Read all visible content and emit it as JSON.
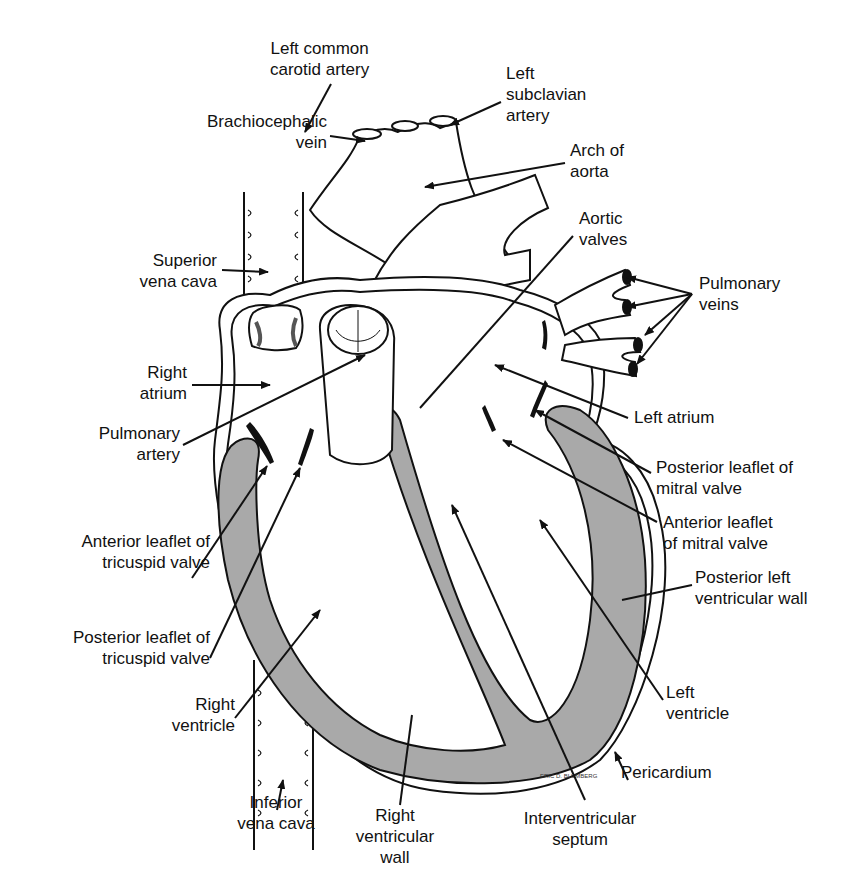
{
  "diagram": {
    "colors": {
      "line": "#111111",
      "muscle": "#a9a9a9",
      "background": "#ffffff"
    },
    "labels": {
      "left_common_carotid": [
        "Left common",
        "carotid artery"
      ],
      "left_subclavian": [
        "Left",
        "subclavian",
        "artery"
      ],
      "brachiocephalic": [
        "Brachiocephalic",
        "vein"
      ],
      "arch_of_aorta": [
        "Arch of",
        "aorta"
      ],
      "aortic_valves": [
        "Aortic",
        "valves"
      ],
      "superior_vena_cava": [
        "Superior",
        "vena cava"
      ],
      "pulmonary_veins": [
        "Pulmonary",
        "veins"
      ],
      "right_atrium": [
        "Right",
        "atrium"
      ],
      "pulmonary_artery": [
        "Pulmonary",
        "artery"
      ],
      "left_atrium": [
        "Left atrium"
      ],
      "posterior_mitral": [
        "Posterior leaflet of",
        "mitral valve"
      ],
      "anterior_mitral": [
        "Anterior leaflet",
        "of mitral valve"
      ],
      "anterior_tricuspid": [
        "Anterior leaflet of",
        "tricuspid valve"
      ],
      "posterior_lv_wall": [
        "Posterior left",
        "ventricular wall"
      ],
      "posterior_tricuspid": [
        "Posterior leaflet of",
        "tricuspid valve"
      ],
      "right_ventricle": [
        "Right",
        "ventricle"
      ],
      "left_ventricle": [
        "Left",
        "ventricle"
      ],
      "pericardium": [
        "Pericardium"
      ],
      "inferior_vena_cava": [
        "Inferior",
        "vena cava"
      ],
      "right_ventricular_wall": [
        "Right",
        "ventricular",
        "wall"
      ],
      "interventricular_septum": [
        "Interventricular",
        "septum"
      ]
    },
    "signature": "ERIC D. BLUMBERG"
  }
}
